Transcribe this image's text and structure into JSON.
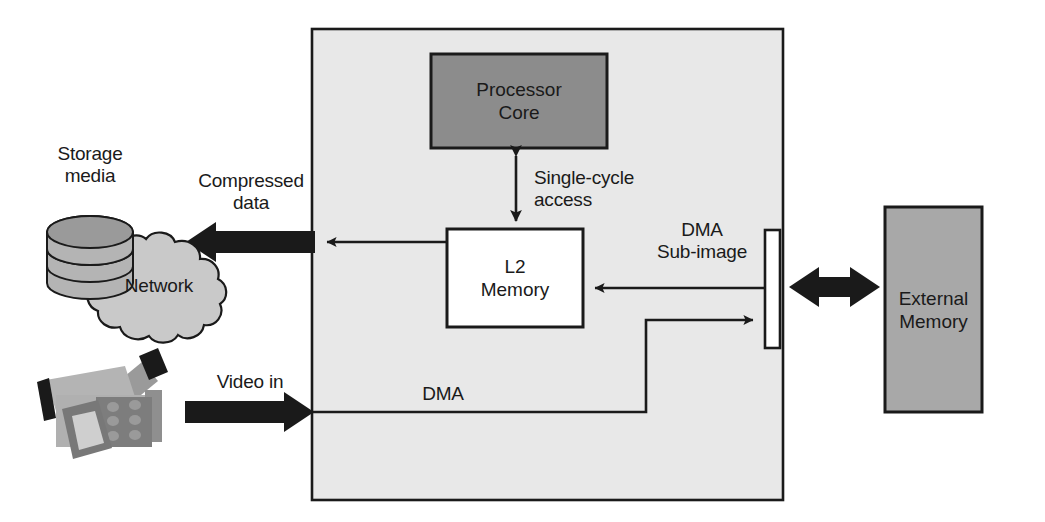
{
  "diagram": {
    "blocks": {
      "processor_core": {
        "label": "Processor\nCore",
        "fill": "#8c8c8c"
      },
      "l2_memory": {
        "label": "L2\nMemory",
        "fill": "#ffffff"
      },
      "external_memory": {
        "label": "External\nMemory",
        "fill": "#a8a8a8"
      },
      "chip": {
        "label": "",
        "fill": "#e8e8e8"
      },
      "dma_port": {
        "label": "",
        "fill": "#ffffff"
      }
    },
    "nodes": {
      "storage_media": {
        "label": "Storage\nmedia"
      },
      "network": {
        "label": "Network"
      },
      "camcorder": {
        "label": ""
      }
    },
    "edge_labels": {
      "compressed_data": "Compressed\ndata",
      "single_cycle_access": "Single-cycle\naccess",
      "dma_sub_image": "DMA\nSub-image",
      "video_in": "Video in",
      "dma": "DMA"
    },
    "colors": {
      "outline": "#1a1a1a",
      "chip_fill": "#e8e8e8",
      "core_fill": "#8c8c8c",
      "ext_mem_fill": "#a8a8a8",
      "cloud_fill": "#c9c9c9",
      "disk_fill": "#b4b4b4",
      "disk_top": "#9a9a9a",
      "cam_body": "#b0b0b0",
      "cam_dark": "#7d7d7d",
      "cam_black": "#1a1a1a",
      "arrow": "#1a1a1a",
      "text": "#1a1a1a"
    }
  }
}
